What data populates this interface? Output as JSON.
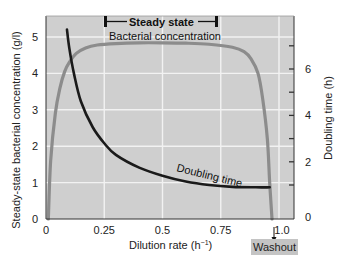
{
  "chart_data": {
    "type": "line",
    "title": "",
    "xlabel": "Dilution rate (h⁻¹)",
    "ylabel": "Steady-state bacterial concentration (g/l)",
    "y2label": "Doubling time (h)",
    "xlim": [
      0,
      1.0
    ],
    "ylim": [
      0,
      5.6
    ],
    "y2lim": [
      0,
      7.5
    ],
    "grid": true,
    "x_ticks": [
      0,
      0.25,
      0.5,
      0.75,
      1.0
    ],
    "x_tick_labels": [
      "0",
      "0.25",
      "0.5",
      "0.75",
      "1.0"
    ],
    "y_ticks": [
      0,
      1,
      2,
      3,
      4,
      5
    ],
    "y_tick_labels": [
      "0",
      "1",
      "2",
      "3",
      "4",
      "5"
    ],
    "y2_ticks": [
      1,
      2,
      3,
      4,
      5,
      6,
      7
    ],
    "y2_tick_labels": [
      "0",
      "2",
      "4",
      "6"
    ],
    "series": [
      {
        "name": "Bacterial concentration",
        "axis": "left",
        "color": "#8c8c8c",
        "x": [
          0.01,
          0.02,
          0.04,
          0.06,
          0.08,
          0.1,
          0.13,
          0.17,
          0.22,
          0.3,
          0.4,
          0.5,
          0.6,
          0.7,
          0.8,
          0.85,
          0.88,
          0.91,
          0.93,
          0.95,
          0.96,
          0.97
        ],
        "values": [
          0,
          1.6,
          2.9,
          3.6,
          4.05,
          4.3,
          4.55,
          4.7,
          4.78,
          4.82,
          4.84,
          4.84,
          4.83,
          4.8,
          4.72,
          4.6,
          4.4,
          4.0,
          3.3,
          2.2,
          1.0,
          0
        ]
      },
      {
        "name": "Doubling time",
        "axis": "right",
        "color": "#1a1a1a",
        "x": [
          0.09,
          0.1,
          0.12,
          0.15,
          0.2,
          0.25,
          0.3,
          0.4,
          0.5,
          0.6,
          0.7,
          0.8,
          0.9,
          0.96
        ],
        "values": [
          7.7,
          6.9,
          5.8,
          4.6,
          3.5,
          2.8,
          2.3,
          1.75,
          1.4,
          1.15,
          1.0,
          0.92,
          0.9,
          0.9
        ]
      }
    ],
    "annotations": [
      {
        "text": "Steady state",
        "type": "bracket",
        "x_range": [
          0.25,
          0.74
        ]
      },
      {
        "text": "Bacterial concentration",
        "type": "series-label"
      },
      {
        "text": "Doubling time",
        "type": "series-label"
      },
      {
        "text": "Washout",
        "type": "marker",
        "x": 0.97
      }
    ]
  },
  "labels": {
    "steady_state": "Steady state",
    "bacterial_concentration": "Bacterial concentration",
    "doubling_time": "Doubling time",
    "washout": "Washout",
    "xlabel": "Dilution rate (h",
    "xlabel_sup": "−1",
    "xlabel_close": ")",
    "ylabel": "Steady-state bacterial concentration (g/l)",
    "y2label": "Doubling time (h)"
  },
  "colors": {
    "plot_bg": "#cfcfcf",
    "grid": "#f2f2f2",
    "concentration": "#8c8c8c",
    "doubling": "#1a1a1a",
    "washout_bg": "#c4c4c4"
  }
}
